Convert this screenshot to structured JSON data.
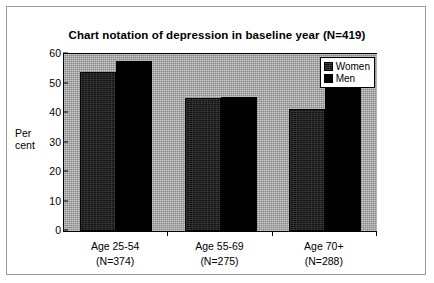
{
  "chart_data": {
    "type": "bar",
    "title": "Chart notation of depression in baseline year (N=419)",
    "xlabel": "",
    "ylabel": "Per cent",
    "ylabel_lines": [
      "Per",
      "cent"
    ],
    "categories": [
      "Age 25-54",
      "Age 55-69",
      "Age 70+"
    ],
    "category_sublabels": [
      "(N=374)",
      "(N=275)",
      "(N=288)"
    ],
    "series": [
      {
        "name": "Women",
        "values": [
          54,
          45,
          41.5
        ],
        "color": "#141414"
      },
      {
        "name": "Men",
        "values": [
          57.5,
          45.5,
          48.5
        ],
        "color": "#000000"
      }
    ],
    "ylim": [
      0,
      60
    ],
    "yticks": [
      0,
      10,
      20,
      30,
      40,
      50,
      60
    ],
    "ytick_labels": [
      "0",
      "10",
      "20",
      "30",
      "40",
      "50",
      "60"
    ],
    "grid": false,
    "legend_position": "top-right",
    "plot_background": "#a8a8a8"
  },
  "legend": {
    "entries": [
      {
        "label": "Women"
      },
      {
        "label": "Men"
      }
    ]
  }
}
